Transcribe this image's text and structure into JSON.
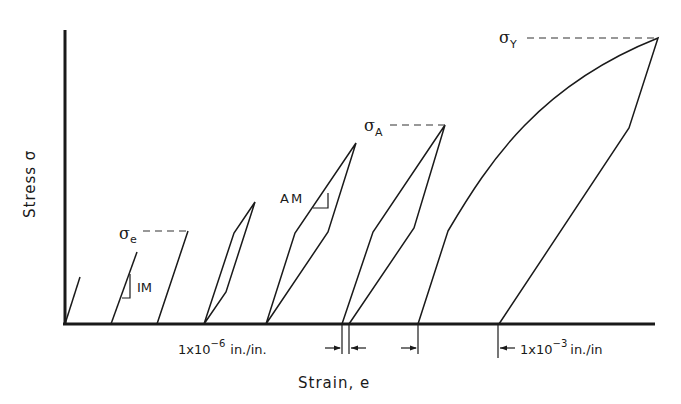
{
  "diagram": {
    "type": "stress-strain hysteresis schematic",
    "axes": {
      "y_label": "Stress σ",
      "x_label": "Strain, e"
    },
    "labels": {
      "sigma_e": {
        "symbol": "σ",
        "sub": "e"
      },
      "sigma_A": {
        "symbol": "σ",
        "sub": "A"
      },
      "sigma_Y": {
        "symbol": "σ",
        "sub": "Y"
      },
      "im": "IM",
      "am": "AM"
    },
    "dimensions": {
      "small": {
        "prefix": "1x10",
        "exp": "−6",
        "unit": "in./in."
      },
      "large": {
        "prefix": "1x10",
        "exp": "−3",
        "unit": "in./in"
      }
    },
    "colors": {
      "line": "#1a1a1a",
      "background": "#ffffff"
    }
  }
}
